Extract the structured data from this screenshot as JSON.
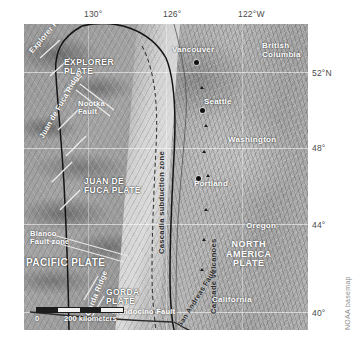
{
  "figure": {
    "basemap_credit": "NOAA basemap",
    "accent_colors": {
      "ocean_label": "#ffffff",
      "dark_label": "#2c2c2c",
      "graticule_label": "#4a4a4a",
      "plate_boundary": "#1a1a1a",
      "city_dot": "#111111"
    }
  },
  "graticule": {
    "longitude_labels": [
      {
        "text": "130°",
        "x": 84,
        "y": 9
      },
      {
        "text": "126°",
        "x": 163,
        "y": 9
      },
      {
        "text": "122°W",
        "x": 238,
        "y": 9
      }
    ],
    "latitude_labels": [
      {
        "text": "52°N",
        "x": 312,
        "y": 73
      },
      {
        "text": "48°",
        "x": 312,
        "y": 148
      },
      {
        "text": "44°",
        "x": 312,
        "y": 224
      },
      {
        "text": "40°",
        "x": 312,
        "y": 312
      }
    ]
  },
  "map": {
    "ocean_plates": [
      {
        "name": "explorer-plate",
        "lines": [
          "EXPLORER",
          "PLATE"
        ],
        "x": 42,
        "y": 38
      },
      {
        "name": "juan-de-fuca-plate",
        "lines": [
          "JUAN DE",
          "FUCA PLATE"
        ],
        "x": 66,
        "y": 180
      },
      {
        "name": "pacific-plate",
        "lines": [
          "PACIFIC PLATE"
        ],
        "x": 8,
        "y": 260
      },
      {
        "name": "gorda-plate",
        "lines": [
          "GORDA",
          "PLATE"
        ],
        "x": 92,
        "y": 290
      }
    ],
    "north_america_plate": {
      "lines": [
        "NORTH",
        "AMERICA",
        "PLATE"
      ],
      "x": 228,
      "y": 243
    },
    "ocean_features": [
      {
        "name": "explorer-ridge",
        "text": "Explorer Ridge",
        "x": 12,
        "y": 30,
        "rotate": -52
      },
      {
        "name": "nootka-fault",
        "lines": [
          "Nootka",
          "Fault"
        ],
        "x": 58,
        "y": 82
      },
      {
        "name": "juan-de-fuca-ridge",
        "text": "Juan de Fuca Ridge",
        "x": 20,
        "y": 150,
        "rotate": -62
      },
      {
        "name": "blanco-fault-zone",
        "lines": [
          "Blanco",
          "Fault zone"
        ],
        "x": 10,
        "y": 228
      },
      {
        "name": "gorda-ridge",
        "text": "Gorda Ridge",
        "x": 70,
        "y": 268,
        "rotate": -70
      },
      {
        "name": "mendocino-fault",
        "text": "Mendocino Fault",
        "x": 96,
        "y": 318
      }
    ],
    "dark_features": [
      {
        "name": "cascadia-subduction-zone",
        "text": "Cascadia subduction zone",
        "x": 146,
        "y": 120,
        "rotate": -88
      },
      {
        "name": "cascade-volcanoes",
        "text": "Cascade volcanoes",
        "x": 208,
        "y": 200,
        "rotate": -88
      },
      {
        "name": "san-andreas-fault",
        "text": "San Andreas Fault",
        "x": 196,
        "y": 306,
        "rotate": -62
      }
    ],
    "regions": [
      {
        "name": "british-columbia",
        "lines": [
          "British",
          "Columbia"
        ],
        "x": 262,
        "y": 34
      },
      {
        "name": "washington",
        "lines": [
          "Washington"
        ],
        "x": 228,
        "y": 136
      },
      {
        "name": "oregon",
        "lines": [
          "Oregon"
        ],
        "x": 248,
        "y": 225
      },
      {
        "name": "california",
        "lines": [
          "California"
        ],
        "x": 214,
        "y": 296
      }
    ],
    "cities": [
      {
        "name": "vancouver",
        "text": "Vancouver",
        "label_x": 176,
        "label_y": 40,
        "dot_x": 195,
        "dot_y": 56
      },
      {
        "name": "seattle",
        "text": "Seattle",
        "label_x": 208,
        "label_y": 96,
        "dot_x": 202,
        "dot_y": 102
      },
      {
        "name": "portland",
        "text": "Portland",
        "label_x": 196,
        "label_y": 178,
        "dot_x": 198,
        "dot_y": 176
      }
    ],
    "scale": {
      "zero": "0",
      "distance": "200 kilometers"
    }
  }
}
